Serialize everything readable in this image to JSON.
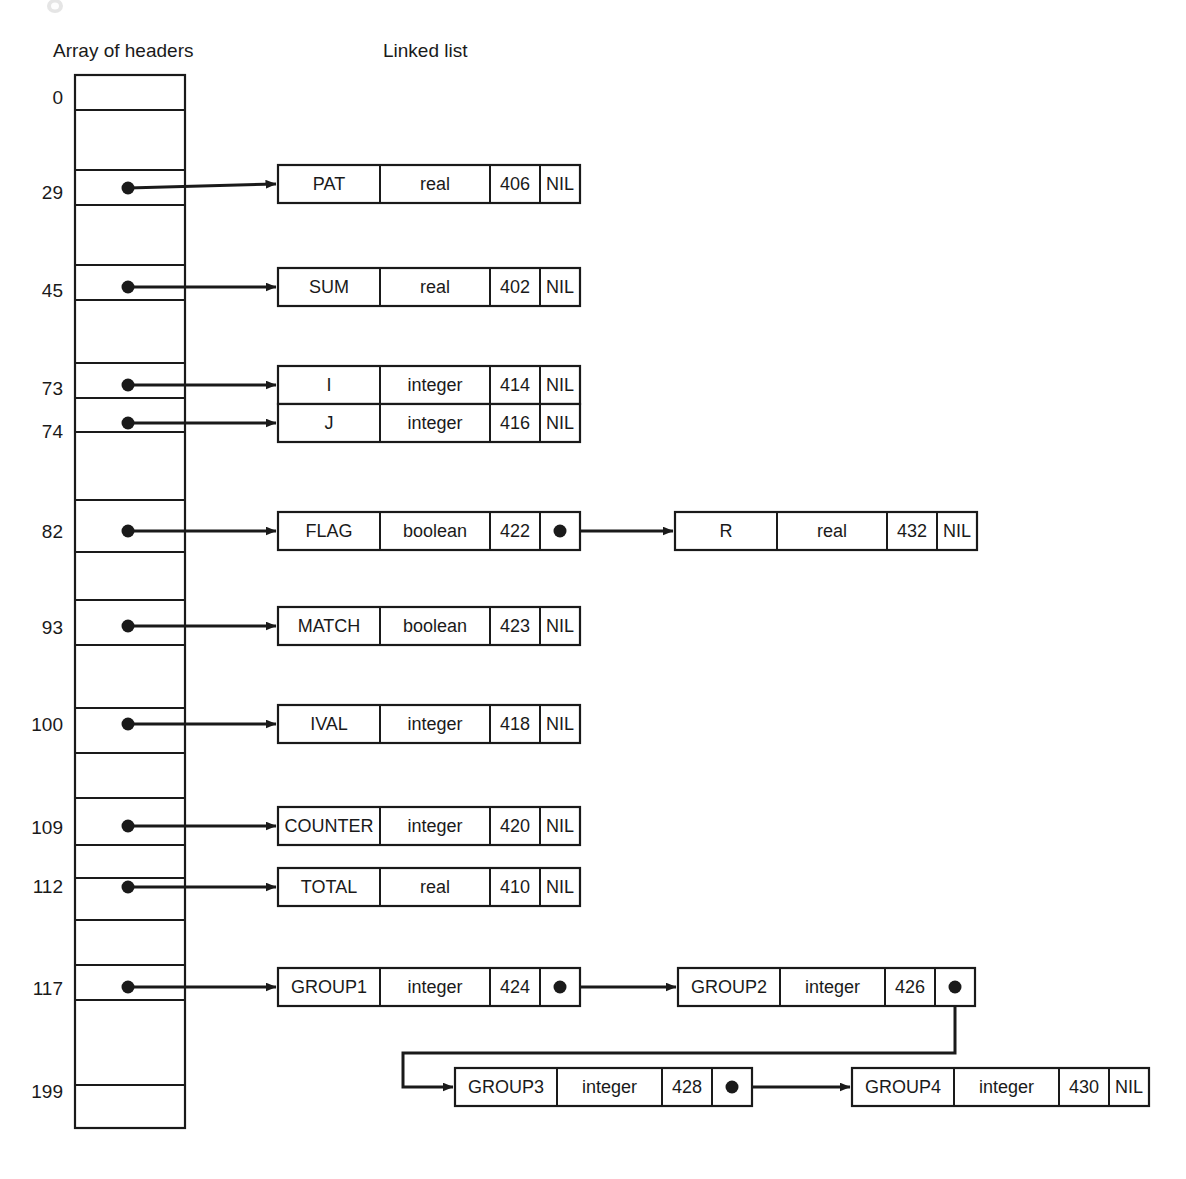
{
  "figure": {
    "array_header_label": "Array of headers",
    "linked_list_label": "Linked list"
  },
  "array": {
    "top": 75,
    "bottom": 1128,
    "left": 75,
    "right": 185,
    "row_boundaries": [
      75,
      110,
      170,
      205,
      265,
      300,
      363,
      398,
      432,
      500,
      552,
      600,
      645,
      708,
      753,
      798,
      845,
      878,
      920,
      965,
      1000,
      1085,
      1128
    ],
    "index_labels": [
      {
        "value": "0",
        "y": 97
      },
      {
        "value": "29",
        "y": 192
      },
      {
        "value": "45",
        "y": 290
      },
      {
        "value": "73",
        "y": 388
      },
      {
        "value": "74",
        "y": 431
      },
      {
        "value": "82",
        "y": 531
      },
      {
        "value": "93",
        "y": 627
      },
      {
        "value": "100",
        "y": 724
      },
      {
        "value": "109",
        "y": 827
      },
      {
        "value": "112",
        "y": 886
      },
      {
        "value": "117",
        "y": 988
      },
      {
        "value": "199",
        "y": 1091
      }
    ]
  },
  "nodes": [
    {
      "id": "PAT",
      "name": "PAT",
      "type": "real",
      "address": "406",
      "next": "NIL",
      "x": 278,
      "y": 165,
      "w": 302,
      "h": 38,
      "cells": [
        102,
        110,
        50,
        40
      ]
    },
    {
      "id": "SUM",
      "name": "SUM",
      "type": "real",
      "address": "402",
      "next": "NIL",
      "x": 278,
      "y": 268,
      "w": 302,
      "h": 38,
      "cells": [
        102,
        110,
        50,
        40
      ]
    },
    {
      "id": "I",
      "name": "I",
      "type": "integer",
      "address": "414",
      "next": "NIL",
      "x": 278,
      "y": 366,
      "w": 302,
      "h": 38,
      "cells": [
        102,
        110,
        50,
        40
      ]
    },
    {
      "id": "J",
      "name": "J",
      "type": "integer",
      "address": "416",
      "next": "NIL",
      "x": 278,
      "y": 404,
      "w": 302,
      "h": 38,
      "cells": [
        102,
        110,
        50,
        40
      ]
    },
    {
      "id": "FLAG",
      "name": "FLAG",
      "type": "boolean",
      "address": "422",
      "next": "",
      "x": 278,
      "y": 512,
      "w": 302,
      "h": 38,
      "cells": [
        102,
        110,
        50,
        40
      ]
    },
    {
      "id": "R",
      "name": "R",
      "type": "real",
      "address": "432",
      "next": "NIL",
      "x": 675,
      "y": 512,
      "w": 302,
      "h": 38,
      "cells": [
        102,
        110,
        50,
        40
      ]
    },
    {
      "id": "MATCH",
      "name": "MATCH",
      "type": "boolean",
      "address": "423",
      "next": "NIL",
      "x": 278,
      "y": 607,
      "w": 302,
      "h": 38,
      "cells": [
        102,
        110,
        50,
        40
      ]
    },
    {
      "id": "IVAL",
      "name": "IVAL",
      "type": "integer",
      "address": "418",
      "next": "NIL",
      "x": 278,
      "y": 705,
      "w": 302,
      "h": 38,
      "cells": [
        102,
        110,
        50,
        40
      ]
    },
    {
      "id": "COUNTER",
      "name": "COUNTER",
      "type": "integer",
      "address": "420",
      "next": "NIL",
      "x": 278,
      "y": 807,
      "w": 302,
      "h": 38,
      "cells": [
        102,
        110,
        50,
        40
      ]
    },
    {
      "id": "TOTAL",
      "name": "TOTAL",
      "type": "real",
      "address": "410",
      "next": "NIL",
      "x": 278,
      "y": 868,
      "w": 302,
      "h": 38,
      "cells": [
        102,
        110,
        50,
        40
      ]
    },
    {
      "id": "GROUP1",
      "name": "GROUP1",
      "type": "integer",
      "address": "424",
      "next": "",
      "x": 278,
      "y": 968,
      "w": 302,
      "h": 38,
      "cells": [
        102,
        110,
        50,
        40
      ]
    },
    {
      "id": "GROUP2",
      "name": "GROUP2",
      "type": "integer",
      "address": "426",
      "next": "",
      "x": 678,
      "y": 968,
      "w": 297,
      "h": 38,
      "cells": [
        102,
        105,
        50,
        40
      ]
    },
    {
      "id": "GROUP3",
      "name": "GROUP3",
      "type": "integer",
      "address": "428",
      "next": "",
      "x": 455,
      "y": 1068,
      "w": 297,
      "h": 38,
      "cells": [
        102,
        105,
        50,
        40
      ]
    },
    {
      "id": "GROUP4",
      "name": "GROUP4",
      "type": "integer",
      "address": "430",
      "next": "NIL",
      "x": 852,
      "y": 1068,
      "w": 297,
      "h": 38,
      "cells": [
        102,
        105,
        50,
        40
      ]
    }
  ],
  "header_links": [
    {
      "index": "29",
      "y": 188,
      "target": "PAT"
    },
    {
      "index": "45",
      "y": 287,
      "target": "SUM"
    },
    {
      "index": "73",
      "y": 385,
      "target": "I"
    },
    {
      "index": "74",
      "y": 423,
      "target": "J"
    },
    {
      "index": "82",
      "y": 531,
      "target": "FLAG"
    },
    {
      "index": "93",
      "y": 626,
      "target": "MATCH"
    },
    {
      "index": "100",
      "y": 724,
      "target": "IVAL"
    },
    {
      "index": "109",
      "y": 826,
      "target": "COUNTER"
    },
    {
      "index": "112",
      "y": 887,
      "target": "TOTAL"
    },
    {
      "index": "117",
      "y": 987,
      "target": "GROUP1"
    }
  ],
  "node_links": [
    {
      "from": "FLAG",
      "to": "R"
    },
    {
      "from": "GROUP1",
      "to": "GROUP2"
    },
    {
      "from": "GROUP2",
      "to": "GROUP3"
    },
    {
      "from": "GROUP3",
      "to": "GROUP4"
    }
  ],
  "colors": {
    "ink": "#1a1a1a",
    "paper": "#ffffff"
  }
}
